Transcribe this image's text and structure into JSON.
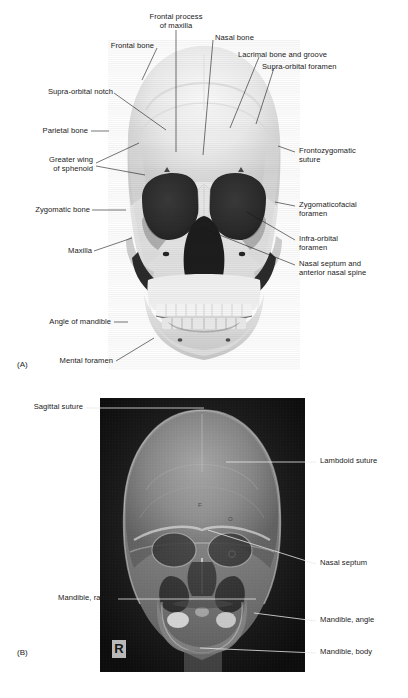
{
  "figure": {
    "panels": [
      {
        "tag": "(A)",
        "name": "three-dimensional-ct-skull-anterior-view",
        "labels": [
          {
            "id": "frontal-process-of-maxilla",
            "text": "Frontal process\nof maxilla"
          },
          {
            "id": "nasal-bone",
            "text": "Nasal bone"
          },
          {
            "id": "frontal-bone",
            "text": "Frontal bone"
          },
          {
            "id": "lacrimal-bone-and-groove",
            "text": "Lacrimal bone and groove"
          },
          {
            "id": "supra-orbital-foramen",
            "text": "Supra-orbital foramen"
          },
          {
            "id": "supra-orbital-notch",
            "text": "Supra-orbital notch"
          },
          {
            "id": "parietal-bone",
            "text": "Parietal bone"
          },
          {
            "id": "greater-wing-of-sphenoid",
            "text": "Greater wing\nof sphenoid"
          },
          {
            "id": "frontozygomatic-suture",
            "text": "Frontozygomatic\nsuture"
          },
          {
            "id": "zygomatic-bone",
            "text": "Zygomatic bone"
          },
          {
            "id": "zygomaticofacial-foramen",
            "text": "Zygomaticofacial\nforamen"
          },
          {
            "id": "infra-orbital-foramen",
            "text": "Infra-orbital\nforamen"
          },
          {
            "id": "maxilla",
            "text": "Maxilla"
          },
          {
            "id": "nasal-septum-and-anterior-nasal-spine",
            "text": "Nasal septum and\nanterior nasal spine"
          },
          {
            "id": "angle-of-mandible",
            "text": "Angle of mandible"
          },
          {
            "id": "mental-foramen",
            "text": "Mental foramen"
          }
        ]
      },
      {
        "tag": "(B)",
        "name": "ap-skull-radiograph",
        "side_marker": "R",
        "orbit_letters": [
          "F",
          "O"
        ],
        "labels": [
          {
            "id": "sagittal-suture",
            "text": "Sagittal suture"
          },
          {
            "id": "lambdoid-suture",
            "text": "Lambdoid suture"
          },
          {
            "id": "nasal-septum",
            "text": "Nasal septum"
          },
          {
            "id": "mandible-ramus",
            "text": "Mandible, ramus"
          },
          {
            "id": "mandible-angle",
            "text": "Mandible, angle"
          },
          {
            "id": "mandible-body",
            "text": "Mandible, body"
          }
        ]
      }
    ]
  },
  "colors": {
    "text": "#1a1a1a",
    "leader": "#1a1a1a",
    "leader_light": "#e8e8e8",
    "radiograph_background": "#0b0b0b",
    "page_background": "#ffffff"
  }
}
